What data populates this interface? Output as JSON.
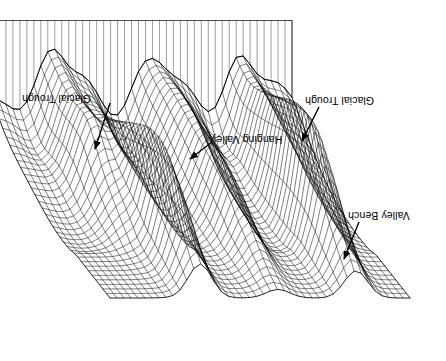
{
  "figure": {
    "orientation_degrees": 180,
    "background_color": "#ffffff",
    "line_color": "#000000",
    "canvas": {
      "width": 446,
      "height": 361
    }
  },
  "annotations": [
    {
      "id": "glacial-trough-left",
      "label": "Glacial Trough",
      "label_x": 22,
      "label_y": 93,
      "arrow": {
        "x1": 110,
        "y1": 103,
        "x2": 95,
        "y2": 149
      }
    },
    {
      "id": "glacial-trough-right",
      "label": "Glacial Trough",
      "label_x": 305,
      "label_y": 95,
      "arrow": {
        "x1": 319,
        "y1": 107,
        "x2": 302,
        "y2": 141
      }
    },
    {
      "id": "hanging-valley",
      "label": "Hanging Valley",
      "label_x": 211,
      "label_y": 134,
      "arrow": {
        "x1": 212,
        "y1": 142,
        "x2": 190,
        "y2": 159
      }
    },
    {
      "id": "valley-bench",
      "label": "Valley Bench",
      "label_x": 348,
      "label_y": 210,
      "arrow": {
        "x1": 359,
        "y1": 222,
        "x2": 344,
        "y2": 259
      }
    }
  ],
  "chart_data": {
    "type": "surface-wireframe",
    "grid": true,
    "legend": false,
    "projection": "oblique-perspective",
    "rows": 34,
    "cols": 44,
    "z_range": [
      0,
      1
    ],
    "plateau_level": 0.78,
    "features": [
      {
        "name": "Glacial Trough",
        "u": 0.18,
        "v": 0.34,
        "depth": 0.62
      },
      {
        "name": "Glacial Trough",
        "u": 0.7,
        "v": 0.3,
        "depth": 0.6
      },
      {
        "name": "Hanging Valley",
        "u": 0.44,
        "v": 0.4,
        "depth": 0.34
      },
      {
        "name": "Valley Bench",
        "u": 0.8,
        "v": 0.66,
        "depth": 0.22
      }
    ],
    "ridge_peaks_u": [
      0.1,
      0.27,
      0.42,
      0.58,
      0.74,
      0.9
    ],
    "xlabel": "",
    "ylabel": "",
    "zlabel": ""
  }
}
